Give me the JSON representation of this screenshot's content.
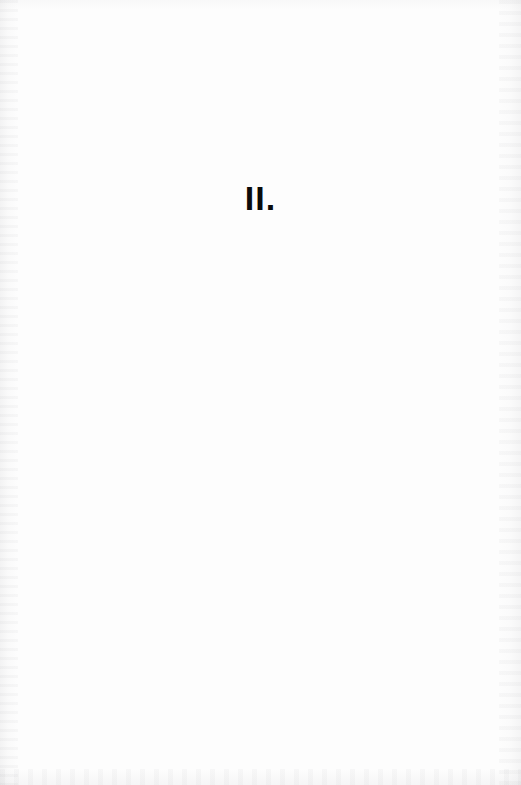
{
  "page": {
    "background_color": "#fdfdfd",
    "ink_color": "#0b0b0b",
    "width": 521,
    "height": 785
  },
  "content": {
    "section_number": "II.",
    "body_text": ""
  },
  "artifacts": {
    "left_edge": "scan-edge-texture",
    "right_edge": "scan-edge-texture",
    "bottom_edge": "scan-edge-texture",
    "top_edge": "scan-edge-texture"
  }
}
